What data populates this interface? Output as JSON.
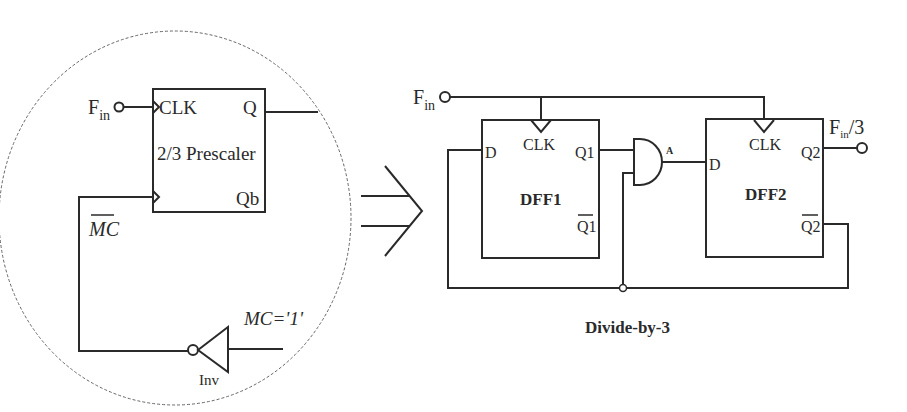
{
  "colors": {
    "stroke": "#2a2a2a",
    "ellipse": "#555555",
    "background": "#ffffff"
  },
  "left_panel": {
    "input": {
      "label_main": "F",
      "label_sub": "in"
    },
    "prescaler": {
      "title": "2/3 Prescaler",
      "clk_label": "CLK",
      "q_label": "Q",
      "qb_label": "Qb"
    },
    "mc_bar_label": "MC",
    "mc_value_label": "MC='1'",
    "inverter_label": "Inv"
  },
  "arrow": {
    "meaning": "implies / equivalent-to"
  },
  "right_panel": {
    "input": {
      "label_main": "F",
      "label_sub": "in"
    },
    "dff1": {
      "name": "DFF1",
      "d_label": "D",
      "clk_label": "CLK",
      "q_label": "Q1",
      "qbar_label": "Q1"
    },
    "and_gate": {
      "output_label": "A"
    },
    "dff2": {
      "name": "DFF2",
      "d_label": "D",
      "clk_label": "CLK",
      "q_label": "Q2",
      "qbar_label": "Q2"
    },
    "output": {
      "label_main": "F",
      "label_sub": "in",
      "label_suffix": "/3"
    },
    "caption": "Divide-by-3"
  }
}
